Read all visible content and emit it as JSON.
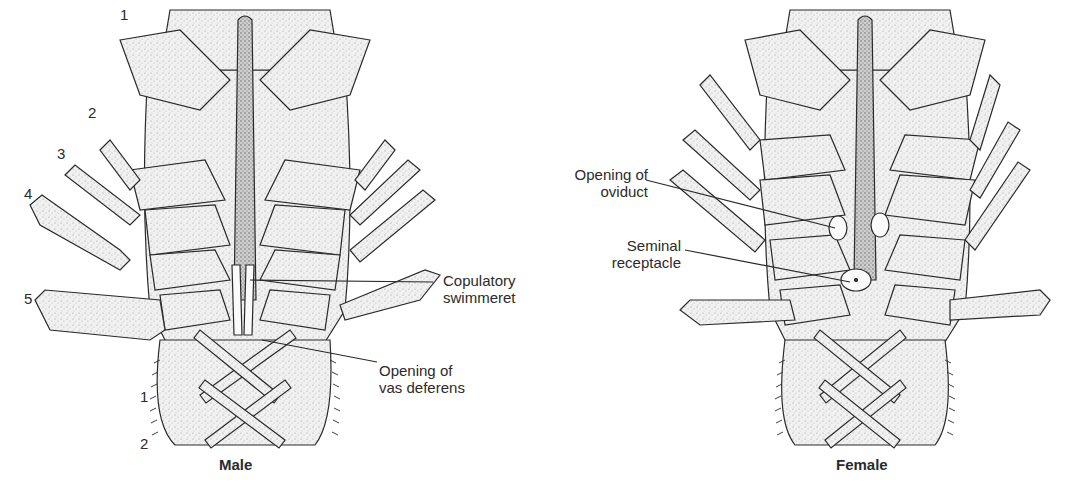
{
  "figure": {
    "panels": [
      {
        "id": "male",
        "caption": "Male",
        "leg_numbers": [
          "1",
          "2",
          "3",
          "4",
          "5"
        ],
        "swimmeret_numbers": [
          "1",
          "2"
        ],
        "callouts": [
          {
            "line1": "Copulatory",
            "line2": "swimmeret"
          },
          {
            "line1": "Opening of",
            "line2": "vas deferens"
          }
        ]
      },
      {
        "id": "female",
        "caption": "Female",
        "callouts": [
          {
            "line1": "Opening of",
            "line2": "oviduct"
          },
          {
            "line1": "Seminal",
            "line2": "receptacle"
          }
        ]
      }
    ]
  },
  "colors": {
    "ink": "#2a2a2a",
    "stipple": "#bdbdbd",
    "fill": "#efefef",
    "background": "#ffffff"
  }
}
